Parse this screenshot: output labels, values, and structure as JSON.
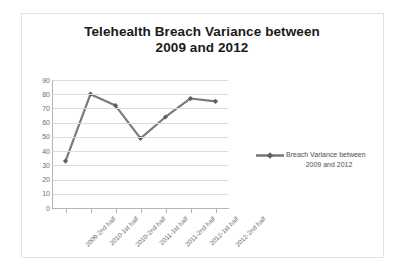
{
  "chart_data": {
    "type": "line",
    "title": "Telehealth Breach Variance between 2009 and 2012",
    "title_line1": "Telehealth Breach Variance between",
    "title_line2": "2009 and 2012",
    "categories": [
      "2009-2nd half",
      "2010-1st half",
      "2010-2nd half",
      "2011-1st half",
      "2011-2nd half",
      "2012-1st half",
      "2012-2nd half"
    ],
    "values": [
      33,
      80,
      72,
      49,
      64,
      77,
      75
    ],
    "series": [
      {
        "name": "Breach Variance between 2009 and 2012",
        "values": [
          33,
          80,
          72,
          49,
          64,
          77,
          75
        ]
      }
    ],
    "xlabel": "",
    "ylabel": "",
    "ylim": [
      0,
      90
    ],
    "yticks": [
      90,
      80,
      70,
      60,
      50,
      40,
      30,
      20,
      10,
      0
    ],
    "ytick_labels": [
      "90",
      "80",
      "70",
      "60",
      "50",
      "40",
      "30",
      "20",
      "10",
      "0"
    ],
    "grid": true,
    "grid_axis": "y",
    "legend": {
      "position": "right",
      "entries": [
        "Breach Variance between 2009 and 2012"
      ],
      "line1": "Breach Variance between",
      "line2": "2009 and 2012"
    },
    "colors": {
      "series_line": "#7a7a7a",
      "marker": "#5e5e5e",
      "gridline": "#dcdcdc",
      "axis": "#b5b5b5",
      "tick_text": "#6d6d6d",
      "title_text": "#1a1a1a",
      "legend_text": "#4d4d4d",
      "frame_border": "#e3e3e3",
      "background": "#ffffff"
    },
    "marker_style": "diamond"
  }
}
